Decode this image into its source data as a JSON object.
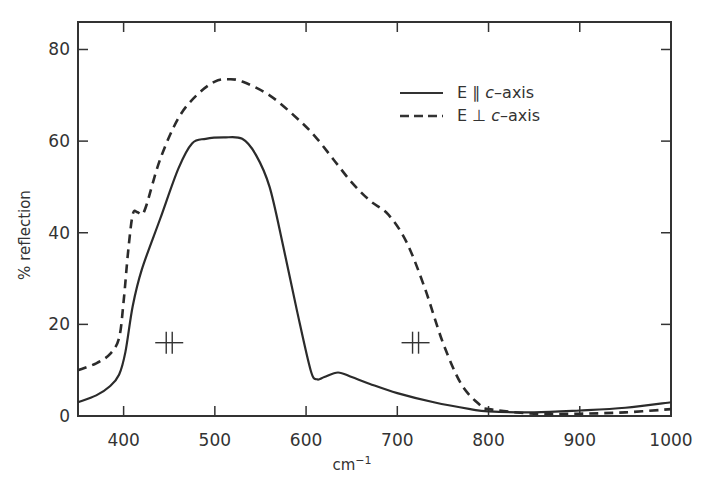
{
  "chart_data": {
    "type": "line",
    "title": "",
    "xlabel": "cm-1",
    "ylabel": "% reflection",
    "xlim": [
      350,
      1000
    ],
    "ylim": [
      0,
      86
    ],
    "grid": false,
    "legend_position": "upper right",
    "x_ticks": [
      "400",
      "500",
      "600",
      "700",
      "800",
      "900",
      "1000"
    ],
    "y_ticks": [
      "0",
      "20",
      "40",
      "60",
      "80"
    ],
    "series": [
      {
        "name": "E || c-axis",
        "style": "solid",
        "x": [
          350,
          370,
          385,
          395,
          402,
          410,
          420,
          440,
          460,
          475,
          490,
          510,
          530,
          545,
          560,
          575,
          590,
          605,
          612,
          620,
          635,
          650,
          670,
          700,
          740,
          780,
          800,
          850,
          900,
          950,
          1000
        ],
        "y": [
          3,
          4.5,
          6.5,
          9,
          14,
          24,
          32,
          43,
          54,
          59.5,
          60.5,
          60.8,
          60.5,
          57,
          50,
          37,
          23,
          10,
          8,
          8.5,
          9.5,
          8.5,
          7,
          5,
          3,
          1.5,
          1,
          0.8,
          1.2,
          1.8,
          3
        ]
      },
      {
        "name": "E ⊥ c-axis",
        "style": "dashed",
        "x": [
          350,
          370,
          385,
          395,
          400,
          405,
          410,
          415,
          420,
          425,
          440,
          460,
          480,
          500,
          515,
          530,
          560,
          590,
          610,
          630,
          650,
          670,
          690,
          710,
          730,
          750,
          770,
          790,
          800,
          850,
          900,
          950,
          1000
        ],
        "y": [
          10,
          11.5,
          13.5,
          17,
          25,
          36,
          44,
          44.5,
          44,
          46,
          56,
          65,
          70,
          73,
          73.5,
          73,
          70,
          65,
          61,
          56,
          51,
          47,
          44,
          38,
          28,
          16,
          7,
          2.5,
          1.5,
          0.5,
          0.5,
          0.8,
          1.5
        ]
      }
    ],
    "annotations": [
      {
        "symbol": "⊣⊢ (slit width marker)",
        "x": 450,
        "y": 16
      },
      {
        "symbol": "⊣⊢ (slit width marker)",
        "x": 720,
        "y": 16
      }
    ]
  },
  "legend": {
    "items": [
      {
        "label_prefix": "E ∥ ",
        "label_italic": "c",
        "label_suffix": "–axis",
        "style": "solid"
      },
      {
        "label_prefix": "E ⊥ ",
        "label_italic": "c",
        "label_suffix": "–axis",
        "style": "dashed"
      }
    ]
  },
  "axes": {
    "xlabel_base": "cm",
    "xlabel_sup": "−1",
    "ylabel": "% reflection"
  },
  "colors": {
    "line": "#2b2b2b",
    "axis": "#333333",
    "background": "#ffffff"
  }
}
